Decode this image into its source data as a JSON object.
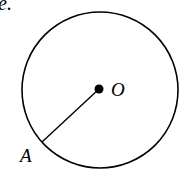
{
  "figure": {
    "caption_fragment": "e.",
    "circle": {
      "cx": 100,
      "cy": 90,
      "r": 78,
      "stroke": "#000000"
    },
    "center_point": {
      "label": "O",
      "x": 99,
      "y": 89
    },
    "point_on_circle": {
      "label": "A",
      "x": 42,
      "y": 142
    },
    "segments": [
      {
        "from": "O",
        "to": "A",
        "name": "radius OA"
      }
    ]
  }
}
